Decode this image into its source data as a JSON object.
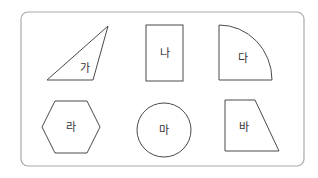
{
  "figure": {
    "frame": {
      "x": 21,
      "y": 12,
      "width": 283,
      "height": 154,
      "radius": 7,
      "stroke": "#a9a9a9"
    },
    "shapes": [
      {
        "id": "ga",
        "type": "triangle",
        "label": "가",
        "points": "47,80 108,26 93,80",
        "label_pos": [
          85,
          68
        ]
      },
      {
        "id": "na",
        "type": "rectangle",
        "label": "나",
        "x": 146,
        "y": 25,
        "w": 37,
        "h": 56,
        "label_pos": [
          164,
          53
        ]
      },
      {
        "id": "da",
        "type": "quarter-circle",
        "label": "다",
        "path": "M219,80 L219,25 A53,55 0 0 1 272,80 Z",
        "label_pos": [
          243,
          58
        ]
      },
      {
        "id": "ra",
        "type": "hexagon",
        "label": "라",
        "points": "42,127 55,101 87,101 100,127 87,153 55,153",
        "label_pos": [
          71,
          127
        ]
      },
      {
        "id": "ma",
        "type": "circle",
        "label": "마",
        "cx": 164,
        "cy": 130,
        "r": 27,
        "label_pos": [
          164,
          130
        ]
      },
      {
        "id": "ba",
        "type": "trapezoid",
        "label": "바",
        "points": "225,100 255,100 279,151 225,151",
        "label_pos": [
          244,
          128
        ]
      }
    ]
  }
}
